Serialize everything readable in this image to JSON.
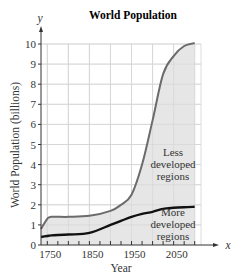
{
  "chart_data": {
    "type": "area",
    "title": "World Population",
    "xlabel": "Year",
    "ylabel": "World Population (billions)",
    "x_axis_letter": "x",
    "y_axis_letter": "y",
    "xlim": [
      1735,
      2115
    ],
    "ylim": [
      0,
      10
    ],
    "x_ticks": [
      1750,
      1850,
      1950,
      2050
    ],
    "y_ticks": [
      0,
      1,
      2,
      3,
      4,
      5,
      6,
      7,
      8,
      9,
      10
    ],
    "grid": true,
    "x": [
      1735,
      1750,
      1760,
      1800,
      1850,
      1900,
      1925,
      1950,
      1975,
      2000,
      2025,
      2050,
      2075,
      2100
    ],
    "series": [
      {
        "name": "Less developed regions (total world population)",
        "values": [
          0.8,
          1.3,
          1.4,
          1.4,
          1.45,
          1.7,
          2.0,
          2.5,
          4.0,
          6.2,
          8.5,
          9.4,
          9.9,
          10.05
        ]
      },
      {
        "name": "More developed regions",
        "values": [
          0.4,
          0.45,
          0.48,
          0.52,
          0.6,
          1.0,
          1.2,
          1.4,
          1.55,
          1.65,
          1.8,
          1.85,
          1.88,
          1.9
        ]
      }
    ],
    "annotations": [
      {
        "text": [
          "Less",
          "developed",
          "regions"
        ]
      },
      {
        "text": [
          "More",
          "developed",
          "regions"
        ]
      }
    ]
  }
}
